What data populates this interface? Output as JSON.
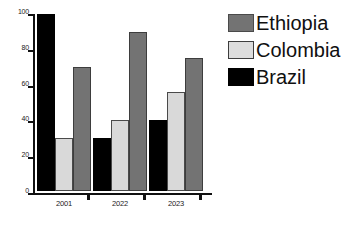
{
  "chart_data": {
    "type": "bar",
    "title": "",
    "xlabel": "",
    "ylabel": "",
    "categories": [
      "2001",
      "2022",
      "2023"
    ],
    "ylim": [
      0,
      100
    ],
    "yticks": [
      0,
      20,
      40,
      60,
      80,
      100
    ],
    "ytick_labels": [
      "0",
      "20",
      "40",
      "60",
      "80",
      "100"
    ],
    "grid": false,
    "legend_position": "right",
    "bar_order_in_group": [
      "Brazil",
      "Colombia",
      "Ethiopia"
    ],
    "series": [
      {
        "name": "Ethiopia",
        "color": "#737373",
        "values": [
          70,
          90,
          75
        ]
      },
      {
        "name": "Colombia",
        "color": "#d9d9d9",
        "values": [
          30,
          40,
          56
        ]
      },
      {
        "name": "Brazil",
        "color": "#000000",
        "values": [
          100,
          30,
          40
        ]
      }
    ]
  },
  "legend": {
    "items": [
      {
        "label": "Ethiopia",
        "swatch": "ethiopia"
      },
      {
        "label": "Colombia",
        "swatch": "colombia"
      },
      {
        "label": "Brazil",
        "swatch": "brazil"
      }
    ]
  }
}
